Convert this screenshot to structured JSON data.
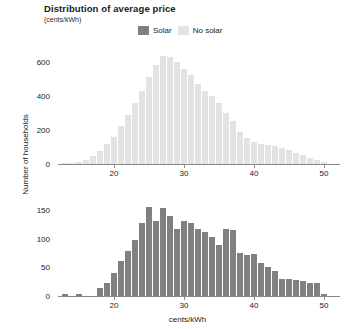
{
  "chart_data": {
    "type": "bar",
    "title": "Distribution of average price",
    "subtitle": "(cents/kWh)",
    "xlabel": "cents/kWh",
    "ylabel": "Number of households",
    "grid": false,
    "legend_position": "top-center",
    "xlim": [
      12,
      52
    ],
    "xticks": [
      20,
      30,
      40,
      50
    ],
    "bin_width": 1,
    "colors": {
      "solar": "#808080",
      "no_solar": "#e3e3e3",
      "axis": "#8a8a8a",
      "text": "#1a1a1a"
    },
    "legend": [
      {
        "label": "Solar",
        "color": "#808080"
      },
      {
        "label": "No solar",
        "color": "#e3e3e3"
      }
    ],
    "panels": [
      {
        "name": "no-solar",
        "series_name": "No solar",
        "color": "#e3e3e3",
        "ylim": [
          0,
          680
        ],
        "yticks": [
          0,
          200,
          400,
          600
        ],
        "x": [
          13,
          14,
          15,
          16,
          17,
          18,
          19,
          20,
          21,
          22,
          23,
          24,
          25,
          26,
          27,
          28,
          29,
          30,
          31,
          32,
          33,
          34,
          35,
          36,
          37,
          38,
          39,
          40,
          41,
          42,
          43,
          44,
          45,
          46,
          47,
          48,
          49,
          50
        ],
        "values": [
          5,
          8,
          14,
          22,
          45,
          78,
          115,
          160,
          225,
          290,
          360,
          430,
          510,
          580,
          635,
          628,
          600,
          555,
          520,
          470,
          430,
          400,
          360,
          300,
          250,
          190,
          150,
          130,
          118,
          112,
          105,
          95,
          80,
          65,
          50,
          38,
          22,
          10
        ]
      },
      {
        "name": "solar",
        "series_name": "Solar",
        "color": "#808080",
        "ylim": [
          0,
          175
        ],
        "yticks": [
          0,
          50,
          100,
          150
        ],
        "x": [
          13,
          14,
          15,
          16,
          17,
          18,
          19,
          20,
          21,
          22,
          23,
          24,
          25,
          26,
          27,
          28,
          29,
          30,
          31,
          32,
          33,
          34,
          35,
          36,
          37,
          38,
          39,
          40,
          41,
          42,
          43,
          44,
          45,
          46,
          47,
          48,
          49,
          50
        ],
        "values": [
          3,
          0,
          4,
          0,
          0,
          14,
          22,
          40,
          62,
          78,
          98,
          128,
          156,
          132,
          154,
          140,
          118,
          132,
          128,
          118,
          112,
          104,
          90,
          118,
          116,
          76,
          72,
          74,
          58,
          50,
          44,
          30,
          30,
          28,
          26,
          22,
          22,
          4
        ]
      }
    ]
  }
}
